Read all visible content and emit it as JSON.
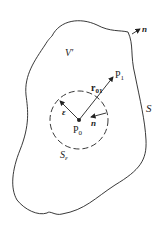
{
  "diagram": {
    "labels": {
      "volume": "V′",
      "surface": "S",
      "small_surface_main": "S",
      "small_surface_sub": "ε",
      "normal_outer": "n",
      "normal_inner": "n",
      "epsilon": "ε",
      "p0_main": "P",
      "p0_sub": "0",
      "p1_main": "P",
      "p1_sub": "1",
      "r01_main": "r",
      "r01_sub": "01"
    },
    "colors": {
      "stroke": "#222222",
      "background": "#ffffff"
    }
  }
}
